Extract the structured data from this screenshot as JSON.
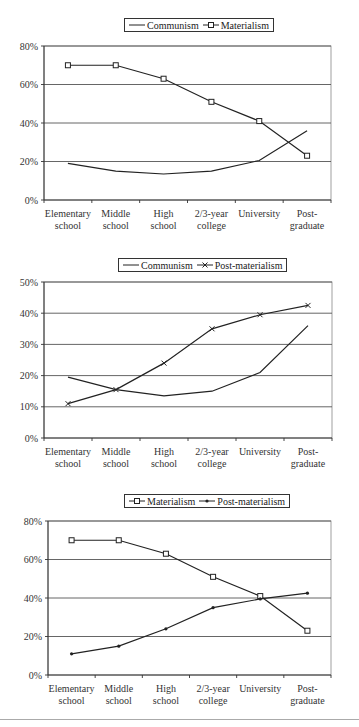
{
  "chart_data": [
    {
      "type": "line",
      "title": "",
      "legend": [
        "Communism",
        "Materialism"
      ],
      "legend_position": "top",
      "categories": [
        "Elementary school",
        "Middle school",
        "High school",
        "2/3-year college",
        "University",
        "Post-graduate"
      ],
      "series": [
        {
          "name": "Communism",
          "marker": "none",
          "values": [
            19,
            15,
            13.5,
            15,
            20.5,
            36
          ]
        },
        {
          "name": "Materialism",
          "marker": "square",
          "values": [
            70,
            70,
            63,
            51,
            41,
            23
          ]
        }
      ],
      "yticks": [
        "0%",
        "20%",
        "40%",
        "60%",
        "80%"
      ],
      "ylim": [
        0,
        80
      ],
      "grid": true,
      "xlabel": "",
      "ylabel": ""
    },
    {
      "type": "line",
      "title": "",
      "legend": [
        "Communism",
        "Post-materialism"
      ],
      "legend_position": "top",
      "categories": [
        "Elementary school",
        "Middle school",
        "High school",
        "2/3-year college",
        "University",
        "Post-graduate"
      ],
      "series": [
        {
          "name": "Communism",
          "marker": "none",
          "values": [
            19.5,
            15.5,
            13.5,
            15,
            21,
            36
          ]
        },
        {
          "name": "Post-materialism",
          "marker": "x",
          "values": [
            11,
            15.5,
            24,
            35,
            39.5,
            42.5
          ]
        }
      ],
      "yticks": [
        "0%",
        "10%",
        "20%",
        "30%",
        "40%",
        "50%"
      ],
      "ylim": [
        0,
        50
      ],
      "grid": true,
      "xlabel": "",
      "ylabel": ""
    },
    {
      "type": "line",
      "title": "",
      "legend": [
        "Materialism",
        "Post-materialism"
      ],
      "legend_position": "top",
      "categories": [
        "Elementary school",
        "Middle school",
        "High school",
        "2/3-year college",
        "University",
        "Post-graduate"
      ],
      "series": [
        {
          "name": "Materialism",
          "marker": "square",
          "values": [
            70,
            70,
            63,
            51,
            41,
            23
          ]
        },
        {
          "name": "Post-materialism",
          "marker": "dot",
          "values": [
            11,
            15,
            24,
            35,
            39.5,
            42.5
          ]
        }
      ],
      "yticks": [
        "0%",
        "20%",
        "40%",
        "60%",
        "80%"
      ],
      "ylim": [
        0,
        80
      ],
      "grid": true,
      "xlabel": "",
      "ylabel": ""
    }
  ],
  "category_lines": [
    [
      "Elementary",
      "school"
    ],
    [
      "Middle",
      "school"
    ],
    [
      "High",
      "school"
    ],
    [
      "2/3-year",
      "college"
    ],
    [
      "University",
      ""
    ],
    [
      "Post-",
      "graduate"
    ]
  ]
}
